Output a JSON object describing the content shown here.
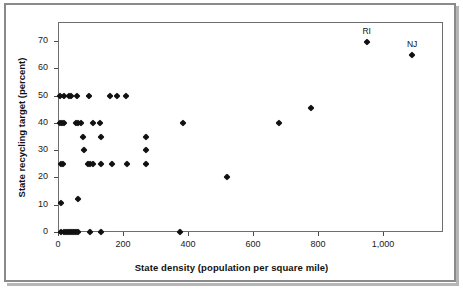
{
  "chart_data": {
    "type": "scatter",
    "title": "",
    "xlabel": "State density (population per square mile)",
    "ylabel": "State recycling target (percent)",
    "xlim": [
      0,
      1185
    ],
    "ylim": [
      0,
      77
    ],
    "grid": false,
    "legend": null,
    "xticks": [
      0,
      200,
      400,
      600,
      800,
      1000
    ],
    "xticklabels": [
      "0",
      "200",
      "400",
      "600",
      "800",
      "1,000"
    ],
    "yticks": [
      0,
      10,
      20,
      30,
      40,
      50,
      60,
      70
    ],
    "yticklabels": [
      "0",
      "10",
      "20",
      "30",
      "40",
      "50",
      "60",
      "70"
    ],
    "marker": "diamond",
    "marker_color": "#111111",
    "points": [
      {
        "x": 10,
        "y": 0
      },
      {
        "x": 18,
        "y": 0
      },
      {
        "x": 25,
        "y": 0
      },
      {
        "x": 30,
        "y": 0
      },
      {
        "x": 36,
        "y": 0
      },
      {
        "x": 42,
        "y": 0
      },
      {
        "x": 48,
        "y": 0
      },
      {
        "x": 56,
        "y": 0
      },
      {
        "x": 62,
        "y": 0
      },
      {
        "x": 100,
        "y": 0
      },
      {
        "x": 133,
        "y": 0
      },
      {
        "x": 375,
        "y": 0
      },
      {
        "x": 9,
        "y": 10.5
      },
      {
        "x": 63,
        "y": 12.2
      },
      {
        "x": 520,
        "y": 20
      },
      {
        "x": 9,
        "y": 25
      },
      {
        "x": 14,
        "y": 25
      },
      {
        "x": 92,
        "y": 25
      },
      {
        "x": 100,
        "y": 25
      },
      {
        "x": 108,
        "y": 25
      },
      {
        "x": 133,
        "y": 25
      },
      {
        "x": 166,
        "y": 25
      },
      {
        "x": 212,
        "y": 25
      },
      {
        "x": 270,
        "y": 25
      },
      {
        "x": 270,
        "y": 30
      },
      {
        "x": 80,
        "y": 30
      },
      {
        "x": 78,
        "y": 35
      },
      {
        "x": 133,
        "y": 35
      },
      {
        "x": 270,
        "y": 34.7
      },
      {
        "x": 5,
        "y": 40
      },
      {
        "x": 12,
        "y": 40
      },
      {
        "x": 20,
        "y": 40
      },
      {
        "x": 55,
        "y": 40
      },
      {
        "x": 63,
        "y": 40
      },
      {
        "x": 72,
        "y": 40
      },
      {
        "x": 108,
        "y": 40
      },
      {
        "x": 130,
        "y": 40
      },
      {
        "x": 385,
        "y": 40
      },
      {
        "x": 680,
        "y": 40
      },
      {
        "x": 778,
        "y": 45.5
      },
      {
        "x": 5,
        "y": 50
      },
      {
        "x": 20,
        "y": 50
      },
      {
        "x": 33,
        "y": 50
      },
      {
        "x": 41,
        "y": 50
      },
      {
        "x": 57,
        "y": 50
      },
      {
        "x": 95,
        "y": 50
      },
      {
        "x": 160,
        "y": 50
      },
      {
        "x": 183,
        "y": 50
      },
      {
        "x": 210,
        "y": 50
      },
      {
        "x": 950,
        "y": 69.5,
        "label": "RI"
      },
      {
        "x": 1090,
        "y": 64.8,
        "label": "NJ"
      }
    ]
  }
}
